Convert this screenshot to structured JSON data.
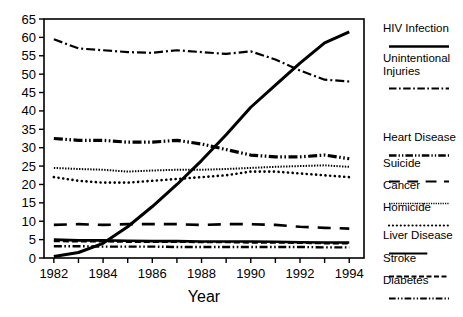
{
  "chart_data": {
    "type": "line",
    "title": "",
    "xlabel": "Year",
    "ylabel": "",
    "x": [
      1982,
      1983,
      1984,
      1985,
      1986,
      1987,
      1988,
      1989,
      1990,
      1991,
      1992,
      1993,
      1994
    ],
    "xlim": [
      1981.6,
      1994.6
    ],
    "ylim": [
      0,
      65
    ],
    "yticks": [
      0,
      5,
      10,
      15,
      20,
      25,
      30,
      35,
      40,
      45,
      50,
      55,
      60,
      65
    ],
    "xticks_labeled": [
      1982,
      1984,
      1986,
      1988,
      1990,
      1992,
      1994
    ],
    "xtick_labels": [
      "1982",
      "1984",
      "1986",
      "1988",
      "1990",
      "1992",
      "1994"
    ],
    "ytick_labels": [
      "0",
      "5",
      "10",
      "15",
      "20",
      "25",
      "30",
      "35",
      "40",
      "45",
      "50",
      "55",
      "60",
      "65"
    ],
    "grid": false,
    "legend_position": "right",
    "series": [
      {
        "name": "HIV Infection",
        "style": "solid-thick",
        "values": [
          0.4,
          1.5,
          4.0,
          8.5,
          14.0,
          20.0,
          26.5,
          33.5,
          41.0,
          47.0,
          53.0,
          58.5,
          61.5
        ]
      },
      {
        "name": "Unintentional Injuries",
        "style": "dash-dot",
        "values": [
          59.5,
          57.0,
          56.5,
          56.0,
          55.8,
          56.5,
          56.0,
          55.5,
          56.2,
          54.0,
          51.0,
          48.5,
          48.0
        ]
      },
      {
        "name": "Heart Disease",
        "style": "dash-dot-dot-thick",
        "values": [
          32.5,
          32.0,
          32.0,
          31.5,
          31.5,
          32.0,
          31.0,
          29.5,
          28.0,
          27.5,
          27.5,
          28.0,
          27.0
        ]
      },
      {
        "name": "Suicide",
        "style": "long-dash",
        "values": [
          9.0,
          9.2,
          9.0,
          9.2,
          9.2,
          9.2,
          9.0,
          9.2,
          9.2,
          9.0,
          8.5,
          8.2,
          8.0
        ]
      },
      {
        "name": "Cancer",
        "style": "fine-dotted",
        "values": [
          24.5,
          24.2,
          24.0,
          23.5,
          23.8,
          24.0,
          24.0,
          24.2,
          24.5,
          24.8,
          25.0,
          25.2,
          24.8
        ]
      },
      {
        "name": "Homicide",
        "style": "round-dots",
        "values": [
          22.0,
          21.0,
          20.5,
          20.5,
          21.0,
          21.5,
          22.0,
          22.5,
          23.5,
          23.5,
          23.0,
          22.5,
          22.0
        ]
      },
      {
        "name": "Liver Disease",
        "style": "solid-thick-short",
        "values": [
          5.0,
          4.8,
          4.8,
          4.7,
          4.6,
          4.6,
          4.5,
          4.5,
          4.5,
          4.4,
          4.3,
          4.2,
          4.2
        ]
      },
      {
        "name": "Stroke",
        "style": "medium-dash",
        "values": [
          4.6,
          4.5,
          4.5,
          4.4,
          4.4,
          4.4,
          4.3,
          4.3,
          4.2,
          4.2,
          4.1,
          4.0,
          4.0
        ]
      },
      {
        "name": "Diabetes",
        "style": "dash-dot-dot",
        "values": [
          3.2,
          3.2,
          3.1,
          3.1,
          3.1,
          3.0,
          3.0,
          3.0,
          3.0,
          3.0,
          3.0,
          2.9,
          2.9
        ]
      }
    ]
  },
  "axis": {
    "xlabel": "Year"
  },
  "legend": {
    "items": [
      {
        "label": "HIV Infection",
        "style": "solid-thick"
      },
      {
        "label": "Unintentional\nInjuries",
        "style": "dash-dot"
      },
      {
        "label": "Heart Disease",
        "style": "dash-dot-dot-thick"
      },
      {
        "label": "Suicide",
        "style": "long-dash"
      },
      {
        "label": "Cancer",
        "style": "fine-dotted"
      },
      {
        "label": "Homicide",
        "style": "round-dots"
      },
      {
        "label": "Liver Disease",
        "style": "solid-thick-short"
      },
      {
        "label": "Stroke",
        "style": "medium-dash"
      },
      {
        "label": "Diabetes",
        "style": "dash-dot-dot"
      }
    ]
  },
  "colors": {
    "ink": "#000000",
    "background": "#ffffff"
  }
}
